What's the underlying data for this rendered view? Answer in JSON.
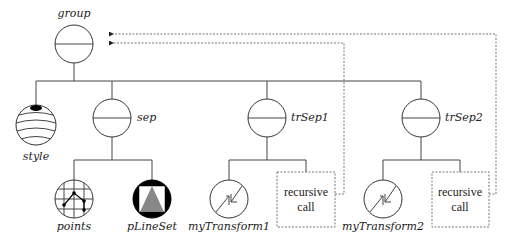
{
  "diagram": {
    "type": "scene-graph",
    "nodes": {
      "group": {
        "label": "group"
      },
      "style": {
        "label": "style"
      },
      "sep": {
        "label": "sep"
      },
      "trSep1": {
        "label": "trSep1"
      },
      "trSep2": {
        "label": "trSep2"
      },
      "points": {
        "label": "points"
      },
      "pLineSet": {
        "label": "pLineSet"
      },
      "myTransform1": {
        "label": "myTransform1"
      },
      "myTransform2": {
        "label": "myTransform2"
      },
      "recursive1": {
        "line1": "recursive",
        "line2": "call"
      },
      "recursive2": {
        "line1": "recursive",
        "line2": "call"
      }
    },
    "edges": [
      [
        "group",
        "style"
      ],
      [
        "group",
        "sep"
      ],
      [
        "group",
        "trSep1"
      ],
      [
        "group",
        "trSep2"
      ],
      [
        "sep",
        "points"
      ],
      [
        "sep",
        "pLineSet"
      ],
      [
        "trSep1",
        "myTransform1"
      ],
      [
        "trSep1",
        "recursive1"
      ],
      [
        "trSep2",
        "myTransform2"
      ],
      [
        "trSep2",
        "recursive2"
      ]
    ],
    "back_references": [
      {
        "from": "recursive1",
        "to": "group",
        "style": "dashed"
      },
      {
        "from": "recursive2",
        "to": "group",
        "style": "dashed"
      }
    ],
    "colors": {
      "stroke": "#333333",
      "dashed": "#777777",
      "triangle": "#888888",
      "fill_dark": "#000000"
    }
  }
}
